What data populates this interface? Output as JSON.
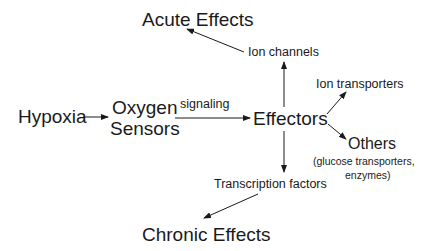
{
  "diagram": {
    "nodes": {
      "hypoxia": "Hypoxia",
      "oxygen_sensors_line1": "Oxygen",
      "oxygen_sensors_line2": "Sensors",
      "effectors": "Effectors",
      "ion_channels": "Ion channels",
      "ion_transporters": "Ion transporters",
      "others": "Others",
      "others_detail_line1": "(glucose transporters,",
      "others_detail_line2": "enzymes)",
      "transcription_factors": "Transcription factors",
      "acute_effects": "Acute Effects",
      "chronic_effects": "Chronic Effects"
    },
    "edge_labels": {
      "signaling": "signaling"
    },
    "edges": [
      {
        "from": "Hypoxia",
        "to": "Oxygen Sensors"
      },
      {
        "from": "Oxygen Sensors",
        "to": "Effectors",
        "label": "signaling"
      },
      {
        "from": "Effectors",
        "to": "Ion channels"
      },
      {
        "from": "Effectors",
        "to": "Ion transporters"
      },
      {
        "from": "Effectors",
        "to": "Others"
      },
      {
        "from": "Effectors",
        "to": "Transcription factors"
      },
      {
        "from": "Ion channels",
        "to": "Acute Effects"
      },
      {
        "from": "Transcription factors",
        "to": "Chronic Effects"
      }
    ],
    "colors": {
      "line": "#1a1a1a",
      "background": "#ffffff"
    }
  }
}
